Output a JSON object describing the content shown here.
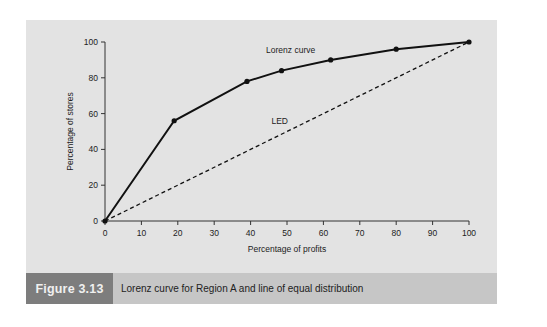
{
  "figure": {
    "label": "Figure 3.13",
    "caption": "Lorenz curve for Region A and line of equal distribution"
  },
  "colors": {
    "panel_bg": "#e3e3e3",
    "caption_bar": "#c6c6c6",
    "caption_label_bg": "#7d7d7d",
    "line": "#111111"
  },
  "chart_data": {
    "type": "line",
    "title": "",
    "xlabel": "Percentage of profits",
    "ylabel": "Percentage of stores",
    "xlim": [
      0,
      100
    ],
    "ylim": [
      0,
      100
    ],
    "x_ticks": [
      0,
      10,
      20,
      30,
      40,
      50,
      60,
      70,
      80,
      90,
      100
    ],
    "y_ticks": [
      0,
      20,
      40,
      60,
      80,
      100
    ],
    "grid": false,
    "series": [
      {
        "name": "Lorenz curve",
        "style": "solid",
        "markers": true,
        "x": [
          0,
          19,
          39,
          48.5,
          62,
          80,
          100
        ],
        "y": [
          0,
          56,
          78,
          84,
          90,
          96,
          100
        ]
      },
      {
        "name": "LED",
        "style": "dashed",
        "markers": false,
        "x": [
          0,
          100
        ],
        "y": [
          0,
          100
        ]
      }
    ],
    "annotations": [
      {
        "text": "Lorenz curve",
        "x": 51,
        "y": 94
      },
      {
        "text": "LED",
        "x": 48,
        "y": 54
      }
    ]
  }
}
